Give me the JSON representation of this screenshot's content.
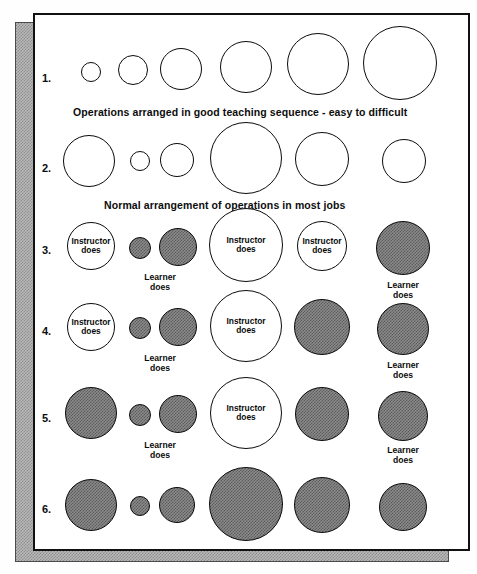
{
  "diagram": {
    "title_rows": [
      "1.",
      "2.",
      "3.",
      "4.",
      "5.",
      "6."
    ],
    "captions": [
      {
        "text": "Operations arranged in good teaching sequence - easy to difficult",
        "after_row": 1
      },
      {
        "text": "Normal arrangement of operations in most jobs",
        "after_row": 2
      }
    ],
    "labels": {
      "instructor": "Instructor\ndoes",
      "instructor_line1": "Instructor",
      "instructor_line2": "does",
      "learner_line1": "Learner",
      "learner_line2": "does"
    },
    "colors": {
      "stroke": "#0b0b0b",
      "open_fill": "#ffffff",
      "hatched_fill": "#8a8a8a",
      "page_bg": "#ffffff",
      "shadow_fill": "#b9b9b9"
    },
    "rows": [
      {
        "number": "1.",
        "label_y": 78,
        "caption": "Operations arranged in good teaching sequence - easy to difficult",
        "caption_x": 73,
        "caption_y": 106,
        "circles": [
          {
            "cx": 91,
            "cy": 72,
            "r": 10,
            "fill": "open",
            "label": ""
          },
          {
            "cx": 133,
            "cy": 70,
            "r": 15,
            "fill": "open",
            "label": ""
          },
          {
            "cx": 181,
            "cy": 69,
            "r": 21,
            "fill": "open",
            "label": ""
          },
          {
            "cx": 246,
            "cy": 67,
            "r": 26,
            "fill": "open",
            "label": ""
          },
          {
            "cx": 318,
            "cy": 64,
            "r": 31,
            "fill": "open",
            "label": ""
          },
          {
            "cx": 400,
            "cy": 63,
            "r": 37,
            "fill": "open",
            "label": ""
          }
        ]
      },
      {
        "number": "2.",
        "label_y": 168,
        "caption": "Normal arrangement of operations in most jobs",
        "caption_x": 104,
        "caption_y": 199,
        "circles": [
          {
            "cx": 89,
            "cy": 161,
            "r": 26,
            "fill": "open",
            "label": ""
          },
          {
            "cx": 140,
            "cy": 161,
            "r": 10,
            "fill": "open",
            "label": ""
          },
          {
            "cx": 177,
            "cy": 160,
            "r": 17,
            "fill": "open",
            "label": ""
          },
          {
            "cx": 246,
            "cy": 158,
            "r": 36,
            "fill": "open",
            "label": ""
          },
          {
            "cx": 322,
            "cy": 159,
            "r": 27,
            "fill": "open",
            "label": ""
          },
          {
            "cx": 404,
            "cy": 161,
            "r": 22,
            "fill": "open",
            "label": ""
          }
        ]
      },
      {
        "number": "3.",
        "label_y": 250,
        "caption": "",
        "circles": [
          {
            "cx": 91,
            "cy": 246,
            "r": 24,
            "fill": "open",
            "label": "instructor"
          },
          {
            "cx": 140,
            "cy": 248,
            "r": 11,
            "fill": "filled",
            "label": "learner_below"
          },
          {
            "cx": 178,
            "cy": 247,
            "r": 19,
            "fill": "filled",
            "label": ""
          },
          {
            "cx": 246,
            "cy": 245,
            "r": 37,
            "fill": "open",
            "label": "instructor"
          },
          {
            "cx": 322,
            "cy": 246,
            "r": 25,
            "fill": "open",
            "label": "instructor"
          },
          {
            "cx": 403,
            "cy": 248,
            "r": 27,
            "fill": "filled",
            "label": "learner_below"
          }
        ],
        "outside_labels": [
          {
            "x": 160,
            "y": 273,
            "text": "Learner\ndoes"
          },
          {
            "x": 403,
            "y": 281,
            "text": "Learner\ndoes"
          }
        ]
      },
      {
        "number": "4.",
        "label_y": 331,
        "caption": "",
        "circles": [
          {
            "cx": 91,
            "cy": 327,
            "r": 24,
            "fill": "open",
            "label": "instructor"
          },
          {
            "cx": 140,
            "cy": 328,
            "r": 11,
            "fill": "filled",
            "label": ""
          },
          {
            "cx": 178,
            "cy": 327,
            "r": 19,
            "fill": "filled",
            "label": ""
          },
          {
            "cx": 246,
            "cy": 326,
            "r": 36,
            "fill": "open",
            "label": "instructor"
          },
          {
            "cx": 322,
            "cy": 327,
            "r": 28,
            "fill": "filled",
            "label": ""
          },
          {
            "cx": 403,
            "cy": 329,
            "r": 26,
            "fill": "filled",
            "label": ""
          }
        ],
        "outside_labels": [
          {
            "x": 160,
            "y": 354,
            "text": "Learner\ndoes"
          },
          {
            "x": 403,
            "y": 361,
            "text": "Learner\ndoes"
          }
        ]
      },
      {
        "number": "5.",
        "label_y": 418,
        "caption": "",
        "circles": [
          {
            "cx": 91,
            "cy": 413,
            "r": 26,
            "fill": "filled",
            "label": ""
          },
          {
            "cx": 140,
            "cy": 415,
            "r": 11,
            "fill": "filled",
            "label": ""
          },
          {
            "cx": 178,
            "cy": 414,
            "r": 19,
            "fill": "filled",
            "label": ""
          },
          {
            "cx": 246,
            "cy": 413,
            "r": 36,
            "fill": "open",
            "label": "instructor"
          },
          {
            "cx": 322,
            "cy": 414,
            "r": 27,
            "fill": "filled",
            "label": ""
          },
          {
            "cx": 403,
            "cy": 416,
            "r": 25,
            "fill": "filled",
            "label": ""
          }
        ],
        "outside_labels": [
          {
            "x": 160,
            "y": 441,
            "text": "Learner\ndoes"
          },
          {
            "x": 403,
            "y": 446,
            "text": "Learner\ndoes"
          }
        ]
      },
      {
        "number": "6.",
        "label_y": 509,
        "caption": "",
        "circles": [
          {
            "cx": 91,
            "cy": 505,
            "r": 26,
            "fill": "filled",
            "label": ""
          },
          {
            "cx": 140,
            "cy": 506,
            "r": 10,
            "fill": "filled",
            "label": ""
          },
          {
            "cx": 177,
            "cy": 505,
            "r": 18,
            "fill": "filled",
            "label": ""
          },
          {
            "cx": 246,
            "cy": 504,
            "r": 37,
            "fill": "filled",
            "label": ""
          },
          {
            "cx": 322,
            "cy": 505,
            "r": 28,
            "fill": "filled",
            "label": ""
          },
          {
            "cx": 403,
            "cy": 507,
            "r": 24,
            "fill": "filled",
            "label": ""
          }
        ]
      }
    ]
  }
}
